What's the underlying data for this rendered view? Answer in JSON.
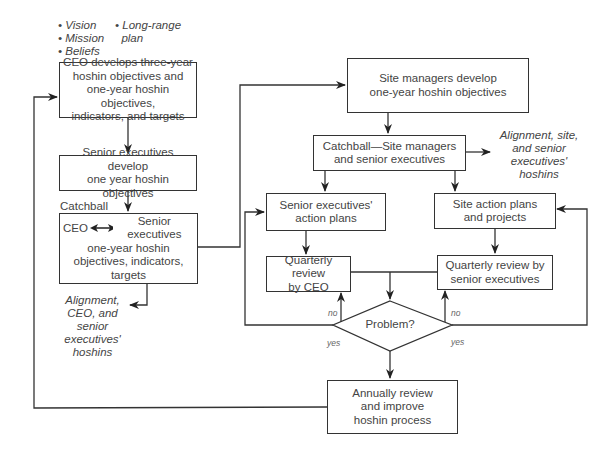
{
  "diagram": {
    "type": "flowchart",
    "top_bullets": {
      "left": [
        "Vision",
        "Mission",
        "Beliefs"
      ],
      "right": [
        "Long-range",
        "plan"
      ]
    },
    "nodes": {
      "ceo_develops": [
        "CEO develops three-year",
        "hoshin objectives and",
        "one-year hoshin objectives,",
        "indicators, and targets"
      ],
      "senior_develop": [
        "Senior executives develop",
        "one year hoshin objectives"
      ],
      "catchball_label": "Catchball",
      "catchball_box": {
        "left": "CEO",
        "right": "Senior executives",
        "rest": [
          "one-year hoshin",
          "objectives, indicators,",
          "targets"
        ]
      },
      "alignment_ceo": [
        "Alignment,",
        "CEO, and",
        "senior",
        "executives'",
        "hoshins"
      ],
      "site_managers": [
        "Site managers develop",
        "one-year hoshin objectives"
      ],
      "catchball_site": [
        "Catchball—Site managers",
        "and senior executives"
      ],
      "alignment_site": [
        "Alignment, site,",
        "and senior",
        "executives'",
        "hoshins"
      ],
      "senior_action": [
        "Senior executives'",
        "action plans"
      ],
      "site_action": [
        "Site action plans",
        "and projects"
      ],
      "quarterly_ceo": [
        "Quarterly review",
        "by CEO"
      ],
      "quarterly_senior": [
        "Quarterly review by",
        "senior executives"
      ],
      "decision": "Problem?",
      "annually": [
        "Annually review",
        "and improve",
        "hoshin process"
      ]
    },
    "edge_labels": {
      "no_left": "no",
      "yes_left": "yes",
      "no_right": "no",
      "yes_right": "yes"
    },
    "colors": {
      "line": "#333333",
      "text": "#444444",
      "background": "#ffffff"
    }
  }
}
